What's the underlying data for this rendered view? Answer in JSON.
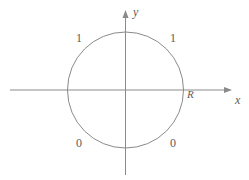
{
  "figure": {
    "name": "circle-boundary-value-diagram",
    "width": 249,
    "height": 180,
    "background_color": "#ffffff",
    "stroke_color": "#8a8a8a",
    "text_color": "#5c5c5c"
  },
  "axes": {
    "x_label": "x",
    "y_label": "y",
    "origin": {
      "x": 125.5,
      "y": 90
    },
    "x_axis": {
      "start_x": 10,
      "end_x": 232,
      "y": 90,
      "arrow": "right"
    },
    "y_axis": {
      "x": 125.5,
      "start_y": 175,
      "end_y": 10,
      "arrow": "up"
    }
  },
  "circle": {
    "center_x": 125.5,
    "center_y": 90,
    "radius": 58,
    "radius_label": "R"
  },
  "boundary_labels": {
    "upper_left": "1",
    "upper_right": "1",
    "lower_left": "0",
    "lower_right": "0"
  }
}
